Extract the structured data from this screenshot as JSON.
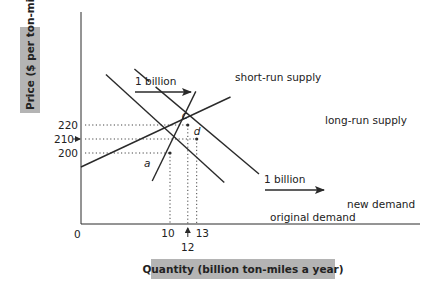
{
  "chart_data": {
    "type": "line",
    "title": "",
    "xlabel": "Quantity (billion ton-miles a year)",
    "ylabel": "Price ($ per ton-mile)",
    "origin_label": "0",
    "x_ticks": [
      {
        "value": 10,
        "label": "10"
      },
      {
        "value": 12,
        "label": "12",
        "arrow": true
      },
      {
        "value": 13,
        "label": "13"
      }
    ],
    "y_ticks": [
      {
        "value": 220,
        "label": "220"
      },
      {
        "value": 210,
        "label": "210",
        "arrow": true
      },
      {
        "value": 200,
        "label": "200"
      }
    ],
    "series": [
      {
        "name": "original demand",
        "points": [
          [
            2.8,
            256
          ],
          [
            16.1,
            179
          ]
        ]
      },
      {
        "name": "new demand",
        "points": [
          [
            6.0,
            260
          ],
          [
            20.0,
            185
          ]
        ]
      },
      {
        "name": "short-run supply",
        "points": [
          [
            8.0,
            180
          ],
          [
            12.9,
            244
          ]
        ]
      },
      {
        "name": "long-run supply",
        "points": [
          [
            0,
            190
          ],
          [
            16.8,
            240
          ]
        ]
      }
    ],
    "points": [
      {
        "label": "a",
        "x": 10,
        "y": 200
      },
      {
        "label": "c",
        "x": 12,
        "y": 220
      },
      {
        "label": "d",
        "x": 13,
        "y": 210
      }
    ],
    "annotations": [
      {
        "text": "1 billion",
        "type": "shift-arrow",
        "position": "upper"
      },
      {
        "text": "1 billion",
        "type": "shift-arrow",
        "position": "lower"
      }
    ],
    "grid": false
  },
  "labels": {
    "short_run_supply": "short-run supply",
    "long_run_supply": "long-run supply",
    "new_demand": "new demand",
    "original_demand": "original demand",
    "shift_upper": "1 billion",
    "shift_lower": "1 billion"
  },
  "colors": {
    "line": "#2a2a2a",
    "axis_title_bg": "#b4b4b4"
  }
}
